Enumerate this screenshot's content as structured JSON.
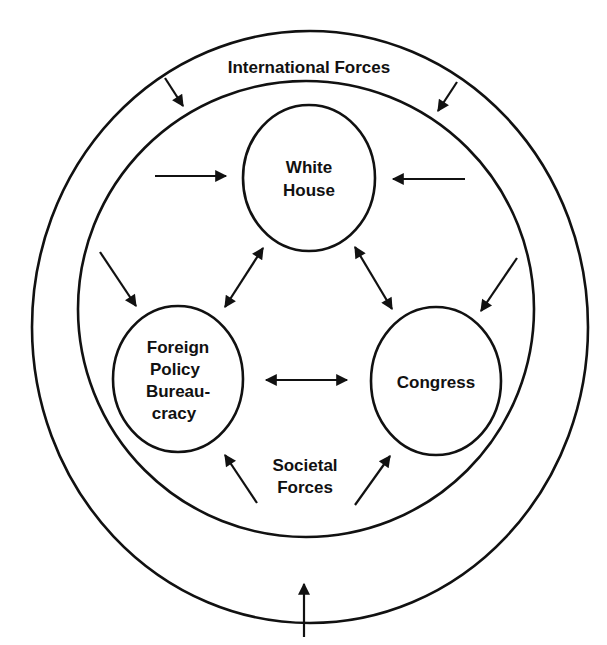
{
  "diagram": {
    "type": "nested-circles-influence-diagram",
    "colors": {
      "stroke": "#111111",
      "background": "#ffffff"
    },
    "outer_ring": {
      "label": "International Forces"
    },
    "inner_ring": {
      "label_line1": "Societal",
      "label_line2": "Forces"
    },
    "nodes": {
      "white_house": {
        "line1": "White",
        "line2": "House"
      },
      "foreign_policy": {
        "line1": "Foreign",
        "line2": "Policy",
        "line3": "Bureau-",
        "line4": "cracy"
      },
      "congress": {
        "line1": "Congress"
      }
    },
    "arrows": [
      {
        "from": "International Forces",
        "to": "Societal Forces",
        "direction": "inward",
        "count": 3
      },
      {
        "from": "Societal Forces",
        "to": "White House",
        "count": 2
      },
      {
        "from": "Societal Forces",
        "to": "Foreign Policy Bureaucracy",
        "count": 2
      },
      {
        "from": "Societal Forces",
        "to": "Congress",
        "count": 2
      },
      {
        "between": [
          "White House",
          "Foreign Policy Bureaucracy"
        ],
        "bidirectional": true
      },
      {
        "between": [
          "White House",
          "Congress"
        ],
        "bidirectional": true
      },
      {
        "between": [
          "Foreign Policy Bureaucracy",
          "Congress"
        ],
        "bidirectional": true
      }
    ]
  }
}
